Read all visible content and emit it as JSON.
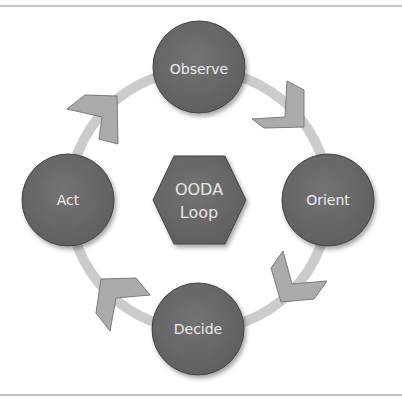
{
  "diagram": {
    "title": "OODA Loop",
    "center": {
      "line1": "OODA",
      "line2": "Loop"
    },
    "nodes": [
      {
        "label": "Observe"
      },
      {
        "label": "Orient"
      },
      {
        "label": "Decide"
      },
      {
        "label": "Act"
      }
    ],
    "colors": {
      "node_fill": "#686868",
      "ring": "#cbcbcb",
      "chevron_fill": "#ababab",
      "chevron_stroke": "#7a7a7a",
      "text": "#ececec"
    }
  }
}
